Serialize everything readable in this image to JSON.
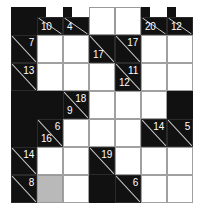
{
  "puzzle": {
    "type": "kakuro",
    "title": "Kakuro 7x7 grid",
    "rows": 7,
    "cols": 7,
    "cell_width": 26,
    "cell_height": 28,
    "colors": {
      "block": "#111111",
      "entry": "#ffffff",
      "highlight": "#b9b9b9",
      "gridline": "#9a9a9a",
      "clue_text": "#ffffff",
      "slash": "#cfcfcf"
    },
    "cells": [
      {
        "r": 0,
        "c": 0,
        "kind": "block"
      },
      {
        "r": 0,
        "c": 1,
        "kind": "tophalf-clue",
        "down": "10"
      },
      {
        "r": 0,
        "c": 2,
        "kind": "tophalf-clue",
        "down": "4"
      },
      {
        "r": 0,
        "c": 3,
        "kind": "blank"
      },
      {
        "r": 0,
        "c": 4,
        "kind": "blank"
      },
      {
        "r": 0,
        "c": 5,
        "kind": "tophalf-clue",
        "down": "20"
      },
      {
        "r": 0,
        "c": 6,
        "kind": "tophalf-clue",
        "down": "12"
      },
      {
        "r": 1,
        "c": 0,
        "kind": "clue",
        "across": "7"
      },
      {
        "r": 1,
        "c": 1,
        "kind": "entry"
      },
      {
        "r": 1,
        "c": 2,
        "kind": "entry"
      },
      {
        "r": 1,
        "c": 3,
        "kind": "clue",
        "down": "17"
      },
      {
        "r": 1,
        "c": 4,
        "kind": "clue",
        "across": "17"
      },
      {
        "r": 1,
        "c": 5,
        "kind": "entry"
      },
      {
        "r": 1,
        "c": 6,
        "kind": "entry"
      },
      {
        "r": 2,
        "c": 0,
        "kind": "clue",
        "across": "13"
      },
      {
        "r": 2,
        "c": 1,
        "kind": "entry"
      },
      {
        "r": 2,
        "c": 2,
        "kind": "entry"
      },
      {
        "r": 2,
        "c": 3,
        "kind": "entry"
      },
      {
        "r": 2,
        "c": 4,
        "kind": "clue",
        "across": "11",
        "down": "12"
      },
      {
        "r": 2,
        "c": 5,
        "kind": "entry"
      },
      {
        "r": 2,
        "c": 6,
        "kind": "entry"
      },
      {
        "r": 3,
        "c": 0,
        "kind": "block"
      },
      {
        "r": 3,
        "c": 1,
        "kind": "block"
      },
      {
        "r": 3,
        "c": 2,
        "kind": "clue",
        "across": "18",
        "down": "9"
      },
      {
        "r": 3,
        "c": 3,
        "kind": "entry"
      },
      {
        "r": 3,
        "c": 4,
        "kind": "entry"
      },
      {
        "r": 3,
        "c": 5,
        "kind": "entry"
      },
      {
        "r": 3,
        "c": 6,
        "kind": "block"
      },
      {
        "r": 4,
        "c": 0,
        "kind": "block"
      },
      {
        "r": 4,
        "c": 1,
        "kind": "clue",
        "across": "6",
        "down": "16"
      },
      {
        "r": 4,
        "c": 2,
        "kind": "entry"
      },
      {
        "r": 4,
        "c": 3,
        "kind": "entry"
      },
      {
        "r": 4,
        "c": 4,
        "kind": "entry"
      },
      {
        "r": 4,
        "c": 5,
        "kind": "clue",
        "across": "14"
      },
      {
        "r": 4,
        "c": 6,
        "kind": "clue",
        "across": "5"
      },
      {
        "r": 5,
        "c": 0,
        "kind": "clue",
        "across": "14"
      },
      {
        "r": 5,
        "c": 1,
        "kind": "entry"
      },
      {
        "r": 5,
        "c": 2,
        "kind": "entry"
      },
      {
        "r": 5,
        "c": 3,
        "kind": "clue",
        "across": "19"
      },
      {
        "r": 5,
        "c": 4,
        "kind": "entry"
      },
      {
        "r": 5,
        "c": 5,
        "kind": "entry"
      },
      {
        "r": 5,
        "c": 6,
        "kind": "entry"
      },
      {
        "r": 6,
        "c": 0,
        "kind": "clue",
        "across": "8"
      },
      {
        "r": 6,
        "c": 1,
        "kind": "gray"
      },
      {
        "r": 6,
        "c": 2,
        "kind": "entry"
      },
      {
        "r": 6,
        "c": 3,
        "kind": "block"
      },
      {
        "r": 6,
        "c": 4,
        "kind": "clue",
        "across": "6"
      },
      {
        "r": 6,
        "c": 5,
        "kind": "entry"
      },
      {
        "r": 6,
        "c": 6,
        "kind": "entry"
      }
    ]
  }
}
